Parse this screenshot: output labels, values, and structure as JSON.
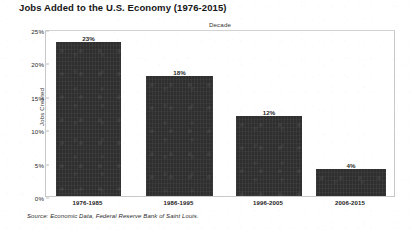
{
  "chart_title": "Jobs Added to the U.S. Economy (1976-2015)",
  "source_note": "Source: Economic Data, Federal Reserve Bank of Saint Louis.",
  "chart_data": {
    "type": "bar",
    "title": "Jobs Added to the U.S. Economy (1976-2015)",
    "xlabel": "Decade",
    "ylabel": "Jobs Created",
    "categories": [
      "1976-1985",
      "1986-1995",
      "1996-2005",
      "2006-2015"
    ],
    "values": [
      23,
      18,
      12,
      4
    ],
    "value_labels": [
      "23%",
      "18%",
      "12%",
      "4%"
    ],
    "ylim": [
      0,
      25
    ],
    "yticks": [
      0,
      5,
      10,
      15,
      20,
      25
    ],
    "ytick_labels": [
      "0%",
      "5%",
      "10%",
      "15%",
      "20%",
      "25%"
    ],
    "grid": false,
    "legend": "none",
    "bar_color": "#2f2f2f"
  }
}
